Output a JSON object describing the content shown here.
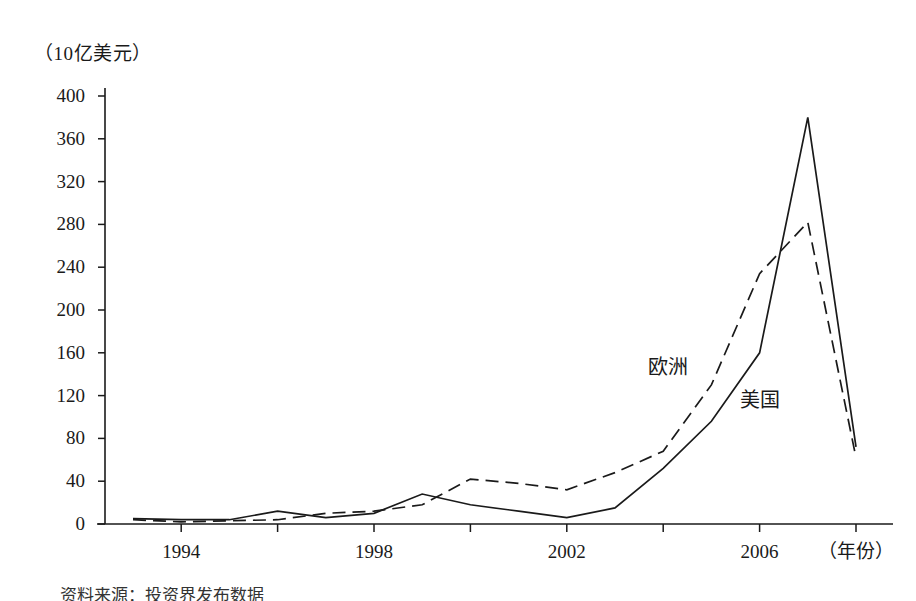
{
  "chart_data": {
    "type": "line",
    "title": "",
    "ylabel": "（10亿美元）",
    "xlabel": "（年份）",
    "ylim": [
      0,
      400
    ],
    "xlim": [
      1993,
      2008
    ],
    "yticks": [
      0,
      40,
      80,
      120,
      160,
      200,
      240,
      280,
      320,
      360,
      400
    ],
    "ytick_labels": [
      "0",
      "40",
      "80",
      "120",
      "160",
      "200",
      "240",
      "280",
      "320",
      "360",
      "400"
    ],
    "xticks": [
      1994,
      1996,
      1998,
      2000,
      2002,
      2004,
      2006,
      2008
    ],
    "xtick_labels": [
      "1994",
      "",
      "1998",
      "",
      "2002",
      "",
      "2006",
      ""
    ],
    "xtick_labels_shown": [
      "1994",
      "1998",
      "2002",
      "2006"
    ],
    "grid": false,
    "legend_position": "inline-annotations",
    "x": [
      1993,
      1994,
      1995,
      1996,
      1997,
      1998,
      1999,
      2000,
      2001,
      2002,
      2003,
      2004,
      2005,
      2006,
      2007,
      2008
    ],
    "series": [
      {
        "name": "美国",
        "style": "solid",
        "color": "#1a1a1a",
        "values": [
          5,
          4,
          4,
          12,
          6,
          10,
          28,
          18,
          12,
          6,
          15,
          52,
          96,
          160,
          380,
          72
        ]
      },
      {
        "name": "欧洲",
        "style": "dashed",
        "color": "#1a1a1a",
        "values": [
          4,
          2,
          3,
          4,
          10,
          12,
          18,
          42,
          38,
          32,
          48,
          68,
          130,
          234,
          282,
          62
        ]
      }
    ],
    "annotations": [
      {
        "text": "欧洲",
        "x_px": 648,
        "y_px": 357
      },
      {
        "text": "美国",
        "x_px": 740,
        "y_px": 390
      }
    ]
  },
  "axis": {
    "unit_label": "（10亿美元）",
    "x_title": "（年份）"
  },
  "caption": {
    "text": "资料来源：投资界发布数据"
  }
}
